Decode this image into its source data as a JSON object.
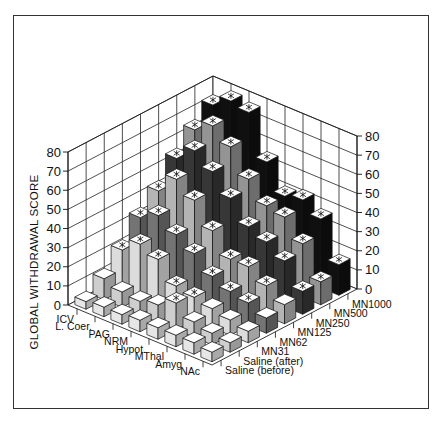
{
  "chart_data": {
    "type": "bar",
    "subtype": "3d-bar",
    "title": "",
    "ylabel": "GLOBAL WITHDRAWAL SCORE",
    "ylim": [
      0,
      80
    ],
    "yticks": [
      0,
      10,
      20,
      30,
      40,
      50,
      60,
      70,
      80
    ],
    "grid": true,
    "sites": [
      "ICV",
      "L. Coer.",
      "PAG",
      "NRM",
      "Hypot.",
      "MThal",
      "Amyg",
      "NAc"
    ],
    "treatments": [
      "Saline (before)",
      "Saline (after)",
      "MN31",
      "MN62",
      "MN125",
      "MN250",
      "MN500",
      "MN1000"
    ],
    "series": [
      {
        "name": "ICV",
        "values": [
          4,
          11,
          21,
          33,
          42,
          54,
          64,
          72
        ]
      },
      {
        "name": "L. Coer.",
        "values": [
          5,
          8,
          28,
          38,
          52,
          62,
          70,
          78
        ]
      },
      {
        "name": "PAG",
        "values": [
          5,
          7,
          24,
          32,
          45,
          55,
          63,
          76
        ]
      },
      {
        "name": "NRM",
        "values": [
          6,
          9,
          14,
          26,
          33,
          45,
          50,
          54
        ]
      },
      {
        "name": "Hypot.",
        "values": [
          6,
          14,
          12,
          18,
          22,
          34,
          40,
          40
        ]
      },
      {
        "name": "MThal",
        "values": [
          6,
          8,
          10,
          14,
          22,
          30,
          38,
          42
        ]
      },
      {
        "name": "Amyg",
        "values": [
          6,
          6,
          8,
          12,
          16,
          24,
          28,
          36
        ]
      },
      {
        "name": "NAc",
        "values": [
          5,
          5,
          6,
          8,
          10,
          12,
          12,
          16
        ]
      }
    ],
    "treatment_colors": [
      "#f2f2f2",
      "#d9d9d9",
      "#e8e8e8",
      "#7a7a7a",
      "#bdbdbd",
      "#3a3a3a",
      "#9c9c9c",
      "#111111"
    ]
  },
  "caption": ""
}
